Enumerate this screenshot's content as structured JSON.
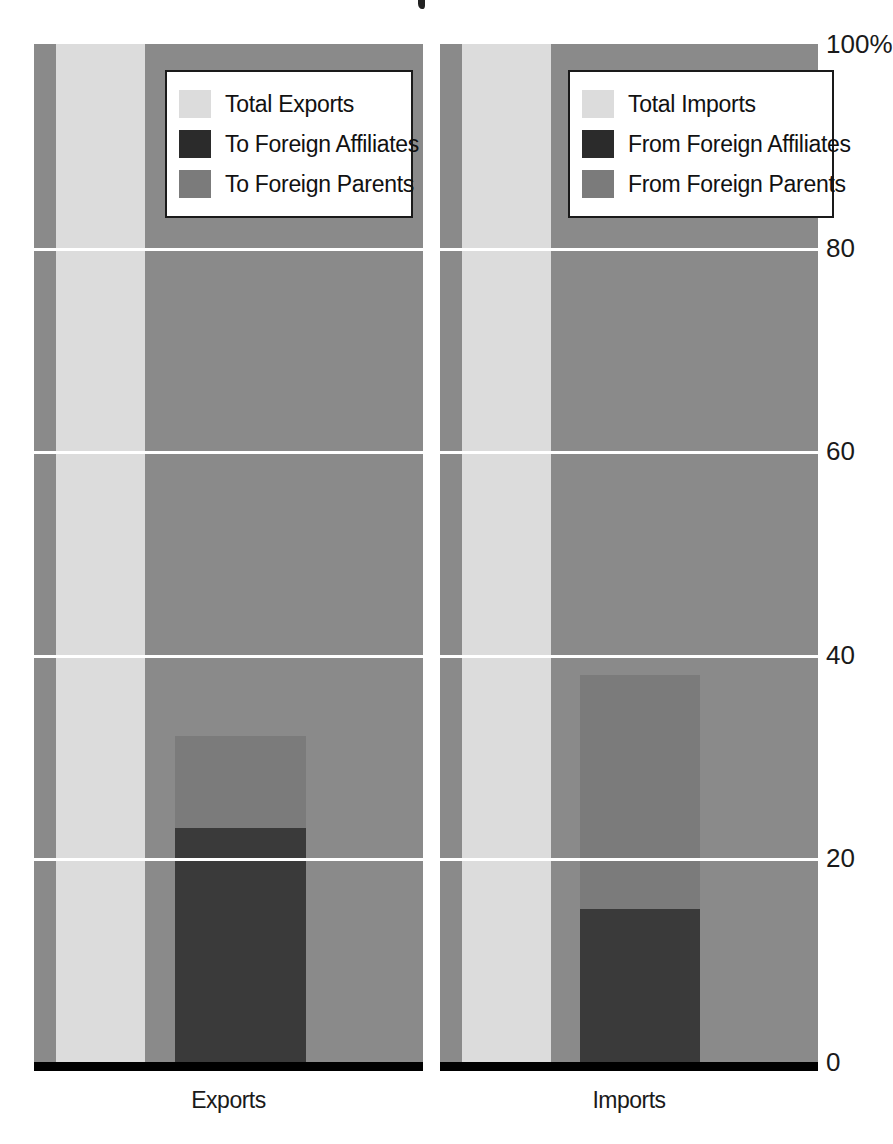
{
  "chart_data": {
    "type": "bar",
    "title": "",
    "xlabel": "",
    "ylabel": "",
    "ylim": [
      0,
      100
    ],
    "yunit": "%",
    "grid": true,
    "legend_position": "inside-top",
    "categories": [
      "Exports",
      "Imports"
    ],
    "yticks": [
      "100%",
      "80",
      "60",
      "40",
      "20",
      "0"
    ],
    "ytick_values": [
      100,
      80,
      60,
      40,
      20,
      0
    ],
    "panels": [
      {
        "category": "Exports",
        "axis_label": "Exports",
        "legend": [
          {
            "label": "Total Exports",
            "swatch": "light",
            "color": "#dcdcdc"
          },
          {
            "label": "To Foreign Affiliates",
            "swatch": "dark",
            "color": "#2b2b2b"
          },
          {
            "label": "To Foreign Parents",
            "swatch": "mid",
            "color": "#7b7b7b"
          }
        ],
        "series": [
          {
            "name": "Total Exports",
            "value": 100
          },
          {
            "name": "To Foreign Parents",
            "value": 32
          },
          {
            "name": "To Foreign Affiliates",
            "value": 23
          }
        ]
      },
      {
        "category": "Imports",
        "axis_label": "Imports",
        "legend": [
          {
            "label": "Total Imports",
            "swatch": "light",
            "color": "#dcdcdc"
          },
          {
            "label": "From Foreign Affiliates",
            "swatch": "dark",
            "color": "#2b2b2b"
          },
          {
            "label": "From Foreign Parents",
            "swatch": "mid",
            "color": "#7b7b7b"
          }
        ],
        "series": [
          {
            "name": "Total Imports",
            "value": 100
          },
          {
            "name": "From Foreign Parents",
            "value": 38
          },
          {
            "name": "From Foreign Affiliates",
            "value": 15
          }
        ]
      }
    ],
    "colors": {
      "total": "#dcdcdc",
      "affiliates": "#2b2b2b",
      "parents": "#7b7b7b",
      "field": "#8a8a8a",
      "gridline": "#ffffff",
      "axis": "#000000",
      "text": "#1a1a1a"
    }
  },
  "axis": {
    "ticks": [
      {
        "label": "100%",
        "value": 100
      },
      {
        "label": "80",
        "value": 80
      },
      {
        "label": "60",
        "value": 60
      },
      {
        "label": "40",
        "value": 40
      },
      {
        "label": "20",
        "value": 20
      },
      {
        "label": "0",
        "value": 0
      }
    ]
  },
  "exports_panel": {
    "axis_label": "Exports",
    "legend": {
      "total": "Total Exports",
      "affiliates": "To Foreign Affiliates",
      "parents": "To Foreign Parents"
    }
  },
  "imports_panel": {
    "axis_label": "Imports",
    "legend": {
      "total": "Total Imports",
      "affiliates": "From Foreign Affiliates",
      "parents": "From Foreign Parents"
    }
  }
}
